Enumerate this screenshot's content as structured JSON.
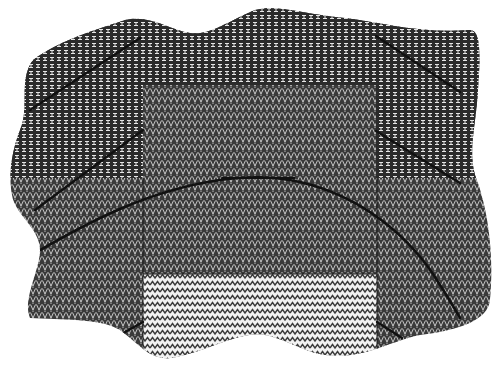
{
  "figure": {
    "background_color": "#ffffff",
    "ink_color": "#1a1a1a",
    "regions": [
      {
        "id": "dark",
        "label": "dark basket-weave ground",
        "pattern": "basket-weave-I",
        "base_color": "#2b2b2b",
        "motif_color": "#e6e6e6"
      },
      {
        "id": "medium",
        "label": "medium herringbone weave",
        "pattern": "herringbone-V",
        "base_color": "#3a3a3a",
        "motif_color": "#d8d8d8"
      },
      {
        "id": "light",
        "label": "light zigzag weave",
        "pattern": "zigzag",
        "base_color": "#f2f2f2",
        "motif_color": "#3c3c3c"
      }
    ],
    "lines": [
      {
        "id": "arch",
        "label": "curved arch seam"
      },
      {
        "id": "arch-cap",
        "label": "arch top bar"
      },
      {
        "id": "diag-upper-left",
        "label": "upper-left diagonal seam"
      },
      {
        "id": "diag-mid-left",
        "label": "middle-left diagonal seam"
      },
      {
        "id": "diag-lower-left",
        "label": "lower-left diagonal seam"
      },
      {
        "id": "diag-upper-right",
        "label": "upper-right diagonal seam"
      },
      {
        "id": "diag-mid-right",
        "label": "middle-right diagonal seam"
      },
      {
        "id": "diag-lower-right",
        "label": "lower-right diagonal seam"
      }
    ]
  }
}
